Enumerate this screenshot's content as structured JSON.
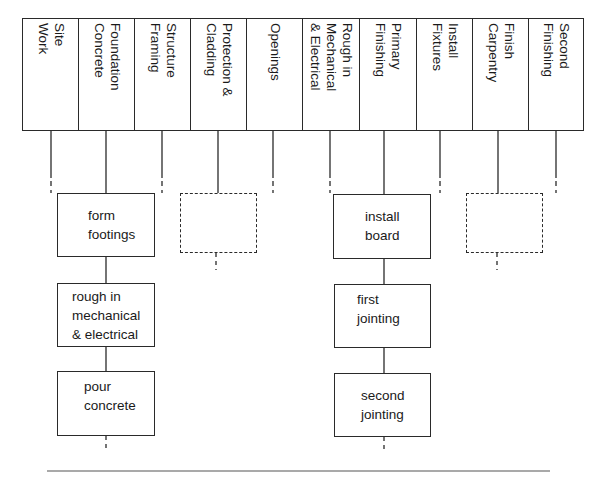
{
  "diagram": {
    "type": "construction-phase-flowchart",
    "phases": [
      {
        "id": "site-work",
        "label": "Site\nWork"
      },
      {
        "id": "foundation-concrete",
        "label": "Foundation\nConcrete"
      },
      {
        "id": "structure-framing",
        "label": "Structure\nFraming"
      },
      {
        "id": "protection-cladding",
        "label": "Protection &\nCladding"
      },
      {
        "id": "openings",
        "label": "Openings"
      },
      {
        "id": "rough-in-mech-elec",
        "label": "Rough in\nMechanical\n& Electrical"
      },
      {
        "id": "primary-finishing",
        "label": "Primary\nFinishing"
      },
      {
        "id": "install-fixtures",
        "label": "Install\nFixtures"
      },
      {
        "id": "finish-carpentry",
        "label": "Finish\nCarpentry"
      },
      {
        "id": "second-finishing",
        "label": "Second\nFinishing"
      }
    ],
    "expansions": [
      {
        "phase": "foundation-concrete",
        "tasks": [
          {
            "label": "form\nfootings"
          },
          {
            "label": "rough in\nmechanical\n& electrical"
          },
          {
            "label": "pour\nconcrete"
          }
        ]
      },
      {
        "phase": "protection-cladding",
        "tasks": [
          {
            "label": "",
            "placeholder": true
          }
        ]
      },
      {
        "phase": "primary-finishing",
        "tasks": [
          {
            "label": "install\nboard"
          },
          {
            "label": "first\njointing"
          },
          {
            "label": "second\njointing"
          }
        ]
      },
      {
        "phase": "finish-carpentry",
        "tasks": [
          {
            "label": "",
            "placeholder": true
          }
        ]
      }
    ]
  },
  "colors": {
    "line": "#2a2a2a",
    "background": "#ffffff",
    "rule": "#555555"
  }
}
